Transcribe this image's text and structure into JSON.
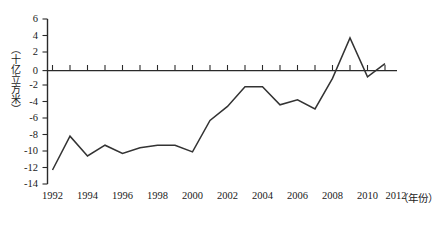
{
  "chart_data": {
    "type": "line",
    "title": "",
    "subtitle": "",
    "xlabel": "（年份）",
    "ylabel": "（十亿立方米）",
    "grid": false,
    "legend": "none",
    "xlim": [
      1992,
      2012
    ],
    "ylim": [
      -14,
      6
    ],
    "ytick_labels": [
      "6",
      "4",
      "2",
      "0",
      "-2",
      "-4",
      "-6",
      "-8",
      "-10",
      "-12",
      "-14"
    ],
    "ytick_values": [
      6,
      4,
      2,
      0,
      -2,
      -4,
      -6,
      -8,
      -10,
      -12,
      -14
    ],
    "xtick_labels": [
      "1992",
      "1994",
      "1996",
      "1998",
      "2000",
      "2002",
      "2004",
      "2006",
      "2008",
      "2010",
      "2012"
    ],
    "xtick_values": [
      1992,
      1994,
      1996,
      1998,
      2000,
      2002,
      2004,
      2006,
      2008,
      2010,
      2012
    ],
    "x": [
      1992,
      1993,
      1994,
      1995,
      1996,
      1997,
      1998,
      1999,
      2000,
      2001,
      2002,
      2003,
      2004,
      2005,
      2006,
      2007,
      2008,
      2009,
      2010,
      2011
    ],
    "values": [
      -12.3,
      -8.2,
      -10.6,
      -9.3,
      -10.3,
      -9.6,
      -9.3,
      -9.3,
      -10.1,
      -6.3,
      -4.6,
      -2.2,
      -2.2,
      -4.4,
      -3.8,
      -4.9,
      -1.2,
      3.7,
      -1.0,
      0.6
    ],
    "series": [
      {
        "name": "天然气净进口量",
        "color": "#333333",
        "values": [
          -12.3,
          -8.2,
          -10.6,
          -9.3,
          -10.3,
          -9.6,
          -9.3,
          -9.3,
          -10.1,
          -6.3,
          -4.6,
          -2.2,
          -2.2,
          -4.4,
          -3.8,
          -4.9,
          -1.2,
          3.7,
          -1.0,
          0.6
        ]
      }
    ]
  },
  "axes": {
    "y_unit_label": "（十亿立方米）",
    "x_unit_label": "（年份）"
  }
}
